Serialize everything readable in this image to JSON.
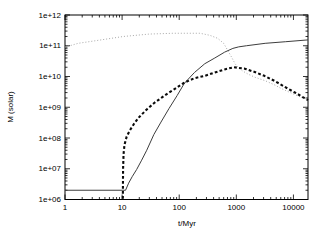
{
  "figure": {
    "background": "#ffffff",
    "frame_color": "#000000",
    "tick_label_font_px": 8,
    "axis_label_font_px": 8
  },
  "chart_data": {
    "type": "line",
    "title": "",
    "xlabel": "t/Myr",
    "ylabel": "M (solar)",
    "x_scale": "log",
    "y_scale": "log",
    "xlim": [
      1,
      18000
    ],
    "ylim": [
      1000000.0,
      1000000000000.0
    ],
    "grid": false,
    "legend": false,
    "x_ticks": [
      {
        "v": 1,
        "label": "1"
      },
      {
        "v": 10,
        "label": "10"
      },
      {
        "v": 100,
        "label": "100"
      },
      {
        "v": 1000,
        "label": "1000"
      },
      {
        "v": 10000,
        "label": "10000"
      }
    ],
    "y_ticks": [
      {
        "v": 1000000.0,
        "label": "1e+06"
      },
      {
        "v": 10000000.0,
        "label": "1e+07"
      },
      {
        "v": 100000000.0,
        "label": "1e+08"
      },
      {
        "v": 1000000000.0,
        "label": "1e+09"
      },
      {
        "v": 10000000000.0,
        "label": "1e+10"
      },
      {
        "v": 100000000000.0,
        "label": "1e+11"
      },
      {
        "v": 1000000000000.0,
        "label": "1e+12"
      }
    ],
    "series": [
      {
        "name": "thin-dotted-line",
        "style": "dotted",
        "color": "#9e9e9e",
        "width": 0.9,
        "dash": "1 2",
        "points": [
          [
            1,
            90000000000.0
          ],
          [
            1.7,
            120000000000.0
          ],
          [
            3.8,
            150000000000.0
          ],
          [
            10.5,
            200000000000.0
          ],
          [
            30,
            240000000000.0
          ],
          [
            80,
            255000000000.0
          ],
          [
            230,
            255000000000.0
          ],
          [
            340,
            220000000000.0
          ],
          [
            470,
            175000000000.0
          ],
          [
            600,
            120000000000.0
          ],
          [
            710,
            70000000000.0
          ],
          [
            830,
            42000000000.0
          ],
          [
            950,
            26000000000.0
          ],
          [
            1100,
            19000000000.0
          ],
          [
            1300,
            15000000000.0
          ],
          [
            1600,
            12000000000.0
          ],
          [
            2100,
            9500000000.0
          ],
          [
            3200,
            7300000000.0
          ],
          [
            4800,
            5200000000.0
          ],
          [
            5900,
            4200000000.0
          ],
          [
            8800,
            3000000000.0
          ],
          [
            13000,
            2200000000.0
          ],
          [
            18000,
            1750000000.0
          ]
        ]
      },
      {
        "name": "solid-line",
        "style": "solid",
        "color": "#3d3d3d",
        "width": 1,
        "dash": "",
        "points": [
          [
            1,
            2000000.0
          ],
          [
            11.5,
            2000000.0
          ],
          [
            13,
            3400000.0
          ],
          [
            15,
            5500000.0
          ],
          [
            18,
            9500000.0
          ],
          [
            22,
            19000000.0
          ],
          [
            27,
            40000000.0
          ],
          [
            36,
            130000000.0
          ],
          [
            48,
            330000000.0
          ],
          [
            66,
            900000000.0
          ],
          [
            92,
            2400000000.0
          ],
          [
            123,
            6000000000.0
          ],
          [
            185,
            13500000000.0
          ],
          [
            280,
            26000000000.0
          ],
          [
            420,
            40000000000.0
          ],
          [
            625,
            62000000000.0
          ],
          [
            870,
            82000000000.0
          ],
          [
            1100,
            92000000000.0
          ],
          [
            1500,
            100000000000.0
          ],
          [
            3200,
            120000000000.0
          ],
          [
            7200,
            135000000000.0
          ],
          [
            18000,
            155000000000.0
          ]
        ]
      },
      {
        "name": "thick-dashed-line",
        "style": "dashed",
        "color": "#0a0a0a",
        "width": 2.1,
        "dash": "2.8 2.2",
        "points": [
          [
            10.3,
            1050000.0
          ],
          [
            10.4,
            10000000.0
          ],
          [
            10.6,
            30000000.0
          ],
          [
            11,
            60000000.0
          ],
          [
            12,
            110000000.0
          ],
          [
            13.5,
            170000000.0
          ],
          [
            16,
            280000000.0
          ],
          [
            19.5,
            460000000.0
          ],
          [
            27,
            850000000.0
          ],
          [
            36,
            1350000000.0
          ],
          [
            50,
            2100000000.0
          ],
          [
            66,
            3000000000.0
          ],
          [
            92,
            4400000000.0
          ],
          [
            123,
            6300000000.0
          ],
          [
            185,
            8800000000.0
          ],
          [
            280,
            10500000000.0
          ],
          [
            420,
            13500000000.0
          ],
          [
            625,
            17000000000.0
          ],
          [
            900,
            20000000000.0
          ],
          [
            1400,
            18000000000.0
          ],
          [
            2100,
            14000000000.0
          ],
          [
            3100,
            10500000000.0
          ],
          [
            4800,
            7000000000.0
          ],
          [
            7200,
            4500000000.0
          ],
          [
            11000,
            2900000000.0
          ],
          [
            18000,
            1700000000.0
          ]
        ]
      }
    ],
    "plot_frame_px": {
      "left": 65,
      "top": 15,
      "right": 308,
      "bottom": 199.5
    }
  }
}
